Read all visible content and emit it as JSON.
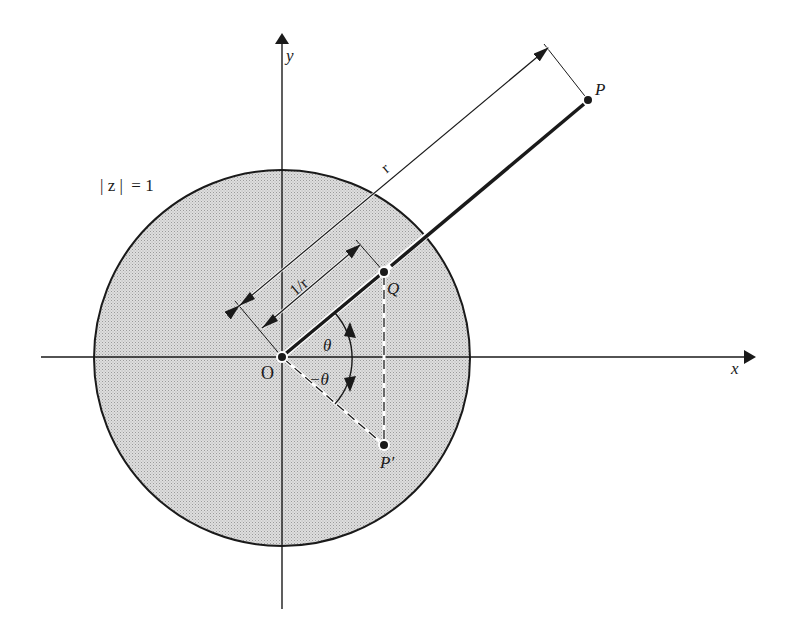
{
  "figure": {
    "colors": {
      "ink": "#1a1a1a",
      "disk_fill": "#d4d4d4",
      "background": "#ffffff"
    },
    "labels": {
      "x_axis": "x",
      "y_axis": "y",
      "circle": "| z |  = 1",
      "origin": "O",
      "point_p": "P",
      "point_q": "Q",
      "point_p_prime": "P′",
      "dim_r": "r",
      "dim_inv_r": "1/r",
      "angle_pos": "θ",
      "angle_neg": "−θ"
    },
    "geometry": {
      "origin": [
        282,
        357
      ],
      "circle_radius": 188,
      "P": [
        588,
        100
      ],
      "Q": [
        384,
        272
      ],
      "P_prime": [
        384,
        445
      ]
    }
  }
}
